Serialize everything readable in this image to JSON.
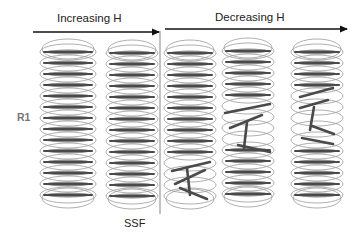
{
  "labels": {
    "increasing": "Increasing H",
    "decreasing": "Decreasing H",
    "r1": "R1",
    "ssf": "SSF"
  },
  "colors": {
    "ring": "#9a9a9a",
    "bar_dark": "#4a4a4a",
    "bar_mid": "#8a8a8a",
    "arrow": "#111111",
    "divider": "#888888",
    "text": "#222222",
    "r1_text": "#777777"
  },
  "arrows": [
    {
      "name": "increasing-h-arrow",
      "x1": 33,
      "x2": 159,
      "y": 32
    },
    {
      "name": "decreasing-h-arrow",
      "x1": 165,
      "x2": 347,
      "y": 29
    }
  ],
  "divider": {
    "x": 160,
    "y1": 31,
    "y2": 214
  },
  "columns": [
    {
      "name": "column-1",
      "cx": 68,
      "rx": 28,
      "top": 52,
      "step": 11,
      "count": 14,
      "distorted": []
    },
    {
      "name": "column-2-ssf",
      "cx": 132,
      "rx": 26,
      "top": 53,
      "step": 11,
      "count": 14,
      "distorted": []
    },
    {
      "name": "column-3",
      "cx": 190,
      "rx": 26,
      "top": 53,
      "step": 11,
      "count": 14,
      "distorted": [
        {
          "row": 10,
          "x1": 172,
          "y1": 171,
          "x2": 210,
          "y2": 162
        },
        {
          "row": 11,
          "x1": 175,
          "y1": 184,
          "x2": 205,
          "y2": 170
        },
        {
          "row": 12,
          "x1": 180,
          "y1": 188,
          "x2": 207,
          "y2": 199
        },
        {
          "row": 13,
          "x1": 187,
          "y1": 168,
          "x2": 190,
          "y2": 195
        }
      ]
    },
    {
      "name": "column-4",
      "cx": 248,
      "rx": 26,
      "top": 51,
      "step": 11,
      "count": 14,
      "distorted": [
        {
          "row": 5,
          "x1": 225,
          "y1": 113,
          "x2": 270,
          "y2": 104
        },
        {
          "row": 6,
          "x1": 230,
          "y1": 128,
          "x2": 262,
          "y2": 115
        },
        {
          "row": 7,
          "x1": 238,
          "y1": 145,
          "x2": 270,
          "y2": 152
        },
        {
          "row": 8,
          "x1": 247,
          "y1": 122,
          "x2": 244,
          "y2": 148
        }
      ]
    },
    {
      "name": "column-5",
      "cx": 317,
      "rx": 26,
      "top": 52,
      "step": 11,
      "count": 14,
      "distorted": [
        {
          "row": 4,
          "x1": 300,
          "y1": 97,
          "x2": 333,
          "y2": 88
        },
        {
          "row": 5,
          "x1": 300,
          "y1": 108,
          "x2": 328,
          "y2": 100
        },
        {
          "row": 6,
          "x1": 312,
          "y1": 126,
          "x2": 334,
          "y2": 134
        },
        {
          "row": 7,
          "x1": 314,
          "y1": 107,
          "x2": 310,
          "y2": 130
        },
        {
          "row": 8,
          "x1": 302,
          "y1": 138,
          "x2": 333,
          "y2": 144
        }
      ]
    }
  ]
}
